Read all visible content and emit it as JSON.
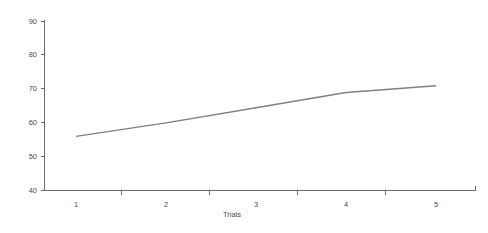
{
  "chart_data": {
    "type": "line",
    "title": "",
    "subtitle": "",
    "xlabel": "Trials",
    "ylabel": "",
    "x": [
      1,
      2,
      3,
      4,
      5
    ],
    "categories": [
      "1",
      "2",
      "3",
      "4",
      "5"
    ],
    "values": [
      56,
      60,
      64.5,
      69,
      71
    ],
    "series": [
      {
        "name": "",
        "values": [
          56,
          60,
          64.5,
          69,
          71
        ]
      }
    ],
    "xtick_labels": [
      "1",
      "2",
      "3",
      "4",
      "5"
    ],
    "ytick_labels": [
      "40",
      "50",
      "60",
      "70",
      "80",
      "90"
    ],
    "ytick_values": [
      40,
      50,
      60,
      70,
      80,
      90
    ],
    "ylim": [
      40,
      90
    ],
    "xlim": [
      0.55,
      5.6
    ],
    "grid": false,
    "legend": false,
    "legend_position": "none",
    "annotations": [],
    "colors": {
      "line": "#808080",
      "axis": "#6b6b6b",
      "text": "#4a4a4a",
      "background": "#ffffff"
    }
  },
  "axes": {
    "y_title": "",
    "x_title": "Trials"
  }
}
